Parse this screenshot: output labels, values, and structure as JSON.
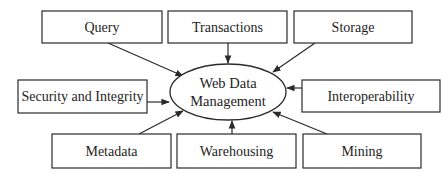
{
  "diagram": {
    "center": {
      "line1": "Web Data",
      "line2": "Management"
    },
    "nodes": {
      "query": "Query",
      "transactions": "Transactions",
      "storage": "Storage",
      "security": "Security and Integrity",
      "interoperability": "Interoperability",
      "metadata": "Metadata",
      "warehousing": "Warehousing",
      "mining": "Mining"
    },
    "colors": {
      "stroke": "#2a2a2a",
      "background": "#ffffff",
      "text": "#1e1e1e"
    }
  }
}
